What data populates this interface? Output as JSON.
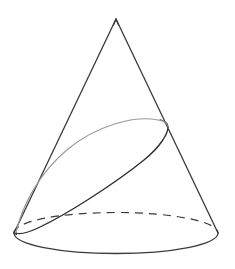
{
  "figure": {
    "title": "Cone with elliptical cross-section",
    "type": "geometric-diagram",
    "canvas": {
      "width": 235,
      "height": 269,
      "background": "#ffffff"
    },
    "colors": {
      "outline": "#3a3a3a",
      "visible_edge": "#2e2e2e",
      "hidden_edge": "#9a9a9a",
      "dashed_edge": "#3a3a3a",
      "background": "#ffffff"
    },
    "stroke": {
      "outline_width": 1.2,
      "hidden_width": 1.1,
      "dash_pattern": "8 6"
    }
  },
  "geometry": {
    "apex": {
      "label": "apex",
      "x": 116,
      "y": 19
    },
    "base_ellipse": {
      "label": "base-circle",
      "cx": 116,
      "cy": 233,
      "rx": 102,
      "ry": 21,
      "front_arc_style": "solid",
      "back_arc_style": "dashed"
    },
    "left_slant": {
      "label": "left-generatrix",
      "x1": 116,
      "y1": 19,
      "x2": 14,
      "y2": 233
    },
    "right_slant": {
      "label": "right-generatrix",
      "x1": 116,
      "y1": 19,
      "x2": 218,
      "y2": 233
    },
    "section_ellipse": {
      "label": "inclined-cross-section",
      "cx": 92,
      "cy": 180,
      "rx": 95,
      "ry": 26,
      "rotation_deg": -36,
      "visible_arc_style": "solid",
      "hidden_arc_style": "light-gray",
      "tangent_point": {
        "x": 16,
        "y": 233
      },
      "upper_point": {
        "x": 168,
        "y": 127
      }
    }
  },
  "chart_data": {
    "type": "diagram",
    "elements": [
      {
        "name": "apex",
        "kind": "point",
        "x": 116,
        "y": 19
      },
      {
        "name": "left-generatrix",
        "kind": "line",
        "from": [
          116,
          19
        ],
        "to": [
          14,
          233
        ]
      },
      {
        "name": "right-generatrix",
        "kind": "line",
        "from": [
          116,
          19
        ],
        "to": [
          218,
          233
        ]
      },
      {
        "name": "base-front-arc",
        "kind": "arc",
        "center": [
          116,
          233
        ],
        "radii": [
          102,
          21
        ],
        "style": "solid"
      },
      {
        "name": "base-back-arc",
        "kind": "arc",
        "center": [
          116,
          233
        ],
        "radii": [
          102,
          21
        ],
        "style": "dashed"
      },
      {
        "name": "section-visible-arc",
        "kind": "arc",
        "style": "solid"
      },
      {
        "name": "section-hidden-arc",
        "kind": "arc",
        "style": "light-gray"
      }
    ]
  }
}
